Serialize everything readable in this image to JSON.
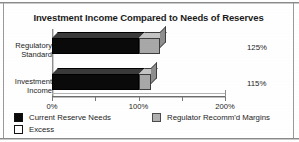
{
  "chart_data": {
    "type": "bar",
    "orientation": "horizontal",
    "stacked": true,
    "title": "Investment Income Compared to Needs of Reserves",
    "xlabel": "",
    "ylabel": "",
    "xlim": [
      0,
      200
    ],
    "grid": false,
    "legend_position": "bottom",
    "categories": [
      "Regulatory Standard",
      "Investment Income"
    ],
    "category_lines": [
      [
        "Regulatory",
        "Standard"
      ],
      [
        "Investment",
        "Income"
      ]
    ],
    "series": [
      {
        "name": "Current Reserve Needs",
        "color": "#0a0a0a",
        "values": [
          100,
          100
        ]
      },
      {
        "name": "Regulator Recomm'd Margins",
        "color": "#a8a8a8",
        "values": [
          25,
          15
        ]
      },
      {
        "name": "Excess",
        "color": "#ffffff",
        "values": [
          0,
          0
        ]
      }
    ],
    "totals": [
      125,
      115
    ],
    "data_labels": [
      "125%",
      "115%"
    ],
    "xticks": [
      0,
      50,
      100,
      150,
      200
    ],
    "xticklabels": [
      "0%",
      "",
      "100%",
      "",
      "200%"
    ],
    "major_xticklabels": [
      "0%",
      "100%",
      "200%"
    ]
  },
  "legend": {
    "items": [
      {
        "label": "Current Reserve Needs",
        "swatch": "black-swatch"
      },
      {
        "label": "Excess",
        "swatch": "white-swatch"
      },
      {
        "label": "Regulator Recomm'd Margins",
        "swatch": "gray-swatch"
      }
    ]
  },
  "colors": {
    "bar_primary": "#0a0a0a",
    "bar_secondary": "#a8a8a8",
    "text": "#1d1d1d",
    "axis": "#6d6d6d",
    "background": "#ffffff"
  }
}
